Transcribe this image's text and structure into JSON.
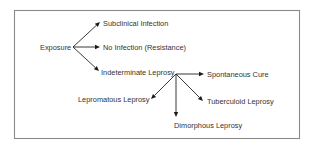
{
  "diagram": {
    "type": "flow",
    "nodes": [
      {
        "id": "exposure",
        "label": "Exposure"
      },
      {
        "id": "subclinical",
        "label": "Subclinical Infection"
      },
      {
        "id": "no_infection",
        "label": "No Infection (Resistance)"
      },
      {
        "id": "indeterminate",
        "label": "Indeterminate Leprosy"
      },
      {
        "id": "spontaneous",
        "label": "Spontaneous Cure"
      },
      {
        "id": "lepromatous",
        "label": "Lepromatous Leprosy"
      },
      {
        "id": "tuberculoid",
        "label": "Tuberculoid Leprosy"
      },
      {
        "id": "dimorphous",
        "label": "Dimorphous Leprosy"
      }
    ],
    "edges": [
      {
        "from": "exposure",
        "to": "subclinical"
      },
      {
        "from": "exposure",
        "to": "no_infection"
      },
      {
        "from": "exposure",
        "to": "indeterminate"
      },
      {
        "from": "indeterminate",
        "to": "spontaneous"
      },
      {
        "from": "indeterminate",
        "to": "lepromatous"
      },
      {
        "from": "indeterminate",
        "to": "tuberculoid"
      },
      {
        "from": "indeterminate",
        "to": "dimorphous"
      }
    ]
  }
}
